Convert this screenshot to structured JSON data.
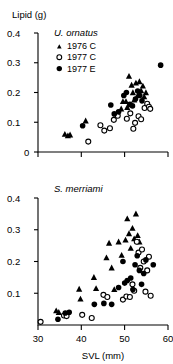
{
  "figure": {
    "y_axis_label": "Lipid (g)",
    "x_axis_label": "SVL (mm)",
    "accent_color": "#000000",
    "background_color": "#ffffff"
  },
  "legend": {
    "position": "top-left-inside-upper-panel",
    "entries": [
      {
        "marker": "filled-triangle",
        "label": "1976 C"
      },
      {
        "marker": "open-circle",
        "label": "1977 C"
      },
      {
        "marker": "filled-circle",
        "label": "1977 E"
      }
    ]
  },
  "panels": [
    {
      "id": "upper",
      "title": "U. ornatus",
      "y_ticks": [
        "0.4",
        "0.3",
        "0.2",
        "0.1",
        "0"
      ],
      "x_ticks": [
        "",
        "",
        "",
        ""
      ]
    },
    {
      "id": "lower",
      "title": "S. merriami",
      "y_ticks": [
        "0.4",
        "0.3",
        "0.2",
        "0.1"
      ],
      "x_ticks": [
        "30",
        "40",
        "50",
        "60"
      ]
    }
  ],
  "chart_data": [
    {
      "type": "scatter",
      "id": "upper",
      "title": "U. ornatus",
      "xlabel": "",
      "ylabel": "Lipid (g)",
      "xlim": [
        30,
        60
      ],
      "ylim": [
        0,
        0.4
      ],
      "grid": false,
      "legend": [
        "1976 C",
        "1977 C",
        "1977 E"
      ],
      "legend_position": "inside-top-left",
      "series": [
        {
          "name": "1976 C",
          "marker": "filled-triangle",
          "points": [
            [
              36.2,
              0.06
            ],
            [
              36.9,
              0.055
            ],
            [
              37.4,
              0.058
            ],
            [
              41.0,
              0.105
            ],
            [
              48.3,
              0.133
            ],
            [
              49.2,
              0.145
            ],
            [
              49.6,
              0.17
            ],
            [
              50.3,
              0.17
            ],
            [
              50.6,
              0.15
            ],
            [
              51.0,
              0.255
            ],
            [
              51.6,
              0.225
            ],
            [
              51.9,
              0.2
            ],
            [
              52.2,
              0.175
            ],
            [
              52.6,
              0.232
            ],
            [
              53.0,
              0.19
            ],
            [
              53.4,
              0.237
            ],
            [
              53.8,
              0.206
            ],
            [
              54.2,
              0.222
            ],
            [
              54.5,
              0.186
            ],
            [
              54.9,
              0.2
            ]
          ]
        },
        {
          "name": "1977 C",
          "marker": "open-circle",
          "points": [
            [
              41.6,
              0.035
            ],
            [
              44.4,
              0.09
            ],
            [
              45.3,
              0.072
            ],
            [
              46.6,
              0.08
            ],
            [
              47.5,
              0.108
            ],
            [
              48.4,
              0.122
            ],
            [
              50.5,
              0.112
            ],
            [
              51.3,
              0.13
            ],
            [
              52.0,
              0.078
            ],
            [
              52.4,
              0.098
            ],
            [
              53.2,
              0.12
            ],
            [
              53.8,
              0.11
            ],
            [
              54.6,
              0.148
            ],
            [
              55.2,
              0.162
            ],
            [
              55.6,
              0.152
            ],
            [
              55.9,
              0.145
            ]
          ]
        },
        {
          "name": "1977 E",
          "marker": "filled-circle",
          "points": [
            [
              40.3,
              0.088
            ],
            [
              46.8,
              0.158
            ],
            [
              47.6,
              0.128
            ],
            [
              48.6,
              0.135
            ],
            [
              49.8,
              0.19
            ],
            [
              50.4,
              0.2
            ],
            [
              51.2,
              0.16
            ],
            [
              51.8,
              0.155
            ],
            [
              52.5,
              0.178
            ],
            [
              53.0,
              0.205
            ],
            [
              53.5,
              0.19
            ],
            [
              54.0,
              0.172
            ],
            [
              58.3,
              0.292
            ]
          ]
        }
      ]
    },
    {
      "type": "scatter",
      "id": "lower",
      "title": "S. merriami",
      "xlabel": "SVL (mm)",
      "ylabel": "Lipid (g)",
      "xlim": [
        30,
        60
      ],
      "ylim": [
        0,
        0.4
      ],
      "grid": false,
      "legend": [
        "1976 C",
        "1977 C",
        "1977 E"
      ],
      "legend_position": "none",
      "series": [
        {
          "name": "1976 C",
          "marker": "filled-triangle",
          "points": [
            [
              34.2,
              0.045
            ],
            [
              34.8,
              0.04
            ],
            [
              39.5,
              0.113
            ],
            [
              39.8,
              0.082
            ],
            [
              42.9,
              0.15
            ],
            [
              43.4,
              0.115
            ],
            [
              45.8,
              0.212
            ],
            [
              46.4,
              0.258
            ],
            [
              47.0,
              0.18
            ],
            [
              47.6,
              0.112
            ],
            [
              48.6,
              0.262
            ],
            [
              49.3,
              0.22
            ],
            [
              50.2,
              0.268
            ],
            [
              50.6,
              0.335
            ],
            [
              51.0,
              0.288
            ],
            [
              51.4,
              0.242
            ],
            [
              51.8,
              0.305
            ],
            [
              52.2,
              0.272
            ],
            [
              52.6,
              0.35
            ],
            [
              53.0,
              0.282
            ],
            [
              53.4,
              0.262
            ]
          ]
        },
        {
          "name": "1977 C",
          "marker": "open-circle",
          "points": [
            [
              30.6,
              0.01
            ],
            [
              36.0,
              0.03
            ],
            [
              36.6,
              0.028
            ],
            [
              40.2,
              0.032
            ],
            [
              42.4,
              0.022
            ],
            [
              45.1,
              0.095
            ],
            [
              46.0,
              0.088
            ],
            [
              49.6,
              0.08
            ],
            [
              50.4,
              0.09
            ],
            [
              51.2,
              0.088
            ],
            [
              51.8,
              0.128
            ],
            [
              52.2,
              0.108
            ],
            [
              52.8,
              0.262
            ],
            [
              53.2,
              0.228
            ],
            [
              53.6,
              0.18
            ],
            [
              54.0,
              0.238
            ],
            [
              54.4,
              0.2
            ],
            [
              54.8,
              0.105
            ],
            [
              55.2,
              0.172
            ],
            [
              55.6,
              0.215
            ],
            [
              56.0,
              0.092
            ]
          ]
        },
        {
          "name": "1977 E",
          "marker": "filled-circle",
          "points": [
            [
              34.6,
              0.018
            ],
            [
              36.3,
              0.038
            ],
            [
              37.2,
              0.04
            ],
            [
              43.0,
              0.065
            ],
            [
              45.2,
              0.068
            ],
            [
              47.0,
              0.065
            ],
            [
              48.6,
              0.118
            ],
            [
              49.6,
              0.2
            ],
            [
              50.0,
              0.132
            ],
            [
              50.6,
              0.14
            ],
            [
              51.4,
              0.148
            ],
            [
              51.9,
              0.112
            ],
            [
              52.4,
              0.19
            ],
            [
              52.9,
              0.218
            ],
            [
              53.4,
              0.172
            ],
            [
              53.9,
              0.128
            ],
            [
              54.4,
              0.162
            ],
            [
              54.9,
              0.205
            ],
            [
              56.6,
              0.19
            ]
          ]
        }
      ]
    }
  ]
}
